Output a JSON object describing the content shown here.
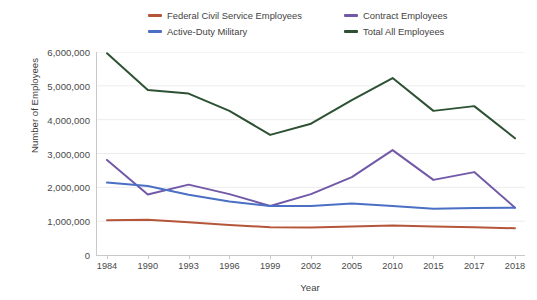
{
  "chart_data": {
    "type": "line",
    "title": "",
    "xlabel": "Year",
    "ylabel": "Number of Employees",
    "categories": [
      "1984",
      "1990",
      "1993",
      "1996",
      "1999",
      "2002",
      "2005",
      "2010",
      "2015",
      "2017",
      "2018"
    ],
    "ylim": [
      0,
      6000000
    ],
    "ytick_values": [
      0,
      1000000,
      2000000,
      3000000,
      4000000,
      5000000,
      6000000
    ],
    "ytick_labels": [
      "0",
      "1,000,000",
      "2,000,000",
      "3,000,000",
      "4,000,000",
      "5,000,000",
      "6,000,000"
    ],
    "grid": "horizontal",
    "legend_position": "top",
    "legend_columns": 2,
    "series": [
      {
        "name": "Federal Civil Service Employees",
        "color": "#b5563a",
        "values": [
          1030000,
          1040000,
          970000,
          890000,
          820000,
          810000,
          840000,
          870000,
          840000,
          820000,
          790000
        ]
      },
      {
        "name": "Contract Employees",
        "color": "#7159a8",
        "values": [
          2810000,
          1790000,
          2080000,
          1800000,
          1450000,
          1800000,
          2300000,
          3100000,
          2220000,
          2450000,
          1400000
        ]
      },
      {
        "name": "Active-Duty Military",
        "color": "#4a6fc4",
        "values": [
          2140000,
          2040000,
          1780000,
          1580000,
          1450000,
          1450000,
          1520000,
          1450000,
          1370000,
          1390000,
          1400000
        ]
      },
      {
        "name": "Total All Employees",
        "color": "#2d5233",
        "values": [
          5960000,
          4880000,
          4770000,
          4260000,
          3550000,
          3880000,
          4580000,
          5230000,
          4260000,
          4400000,
          3450000
        ]
      }
    ]
  }
}
